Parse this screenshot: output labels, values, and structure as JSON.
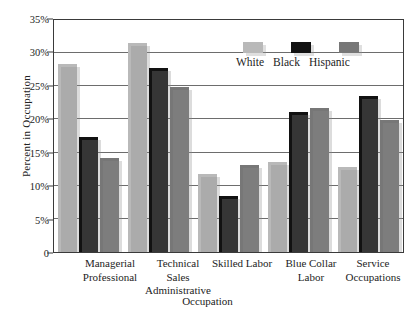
{
  "chart_data": {
    "type": "bar",
    "title": "",
    "xlabel": "Occupation",
    "ylabel": "Percent in Occupation",
    "categories": [
      "Managerial\nProfessional",
      "Technical\nSales\nAdministrative",
      "Skilled Labor",
      "Blue Collar\nLabor",
      "Service\nOccupations"
    ],
    "series": [
      {
        "name": "White",
        "color": "#b9b9b9",
        "values": [
          28.4,
          31.5,
          11.8,
          13.6,
          12.8
        ]
      },
      {
        "name": "Black",
        "color": "#121212",
        "values": [
          17.4,
          27.7,
          8.4,
          21.1,
          23.6
        ]
      },
      {
        "name": "Hispanic",
        "color": "#777777",
        "values": [
          14.2,
          24.9,
          13.2,
          21.7,
          19.9
        ]
      }
    ],
    "ylim": [
      0,
      35
    ],
    "ytick_values": [
      0,
      5,
      10,
      15,
      20,
      25,
      30,
      35
    ],
    "ytick_labels": [
      "0",
      "5%",
      "10%",
      "15%",
      "20%",
      "25%",
      "30%",
      "35%"
    ],
    "grid": true,
    "legend_position": "upper-center"
  },
  "axis": {
    "ylabel": "Percent in Occupation",
    "xlabel": "Occupation"
  },
  "legend": {
    "entries": [
      {
        "label": "White"
      },
      {
        "label": "Black"
      },
      {
        "label": "Hispanic"
      }
    ]
  },
  "xcats": [
    {
      "line1": "Managerial",
      "line2": "Professional",
      "line3": ""
    },
    {
      "line1": "Technical",
      "line2": "Sales",
      "line3": "Administrative"
    },
    {
      "line1": "Skilled Labor",
      "line2": "",
      "line3": ""
    },
    {
      "line1": "Blue Collar",
      "line2": "Labor",
      "line3": ""
    },
    {
      "line1": "Service",
      "line2": "Occupations",
      "line3": ""
    }
  ]
}
